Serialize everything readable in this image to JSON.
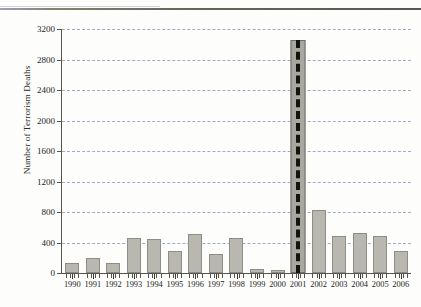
{
  "chart_data": {
    "type": "bar",
    "title": "",
    "xlabel": "",
    "ylabel": "Number of Terrorism Deaths",
    "ylim": [
      0,
      3200
    ],
    "ytick_labels": [
      "0",
      "400",
      "800",
      "1200",
      "1600",
      "2000",
      "2400",
      "2800",
      "3200"
    ],
    "ytick_values": [
      0,
      400,
      800,
      1200,
      1600,
      2000,
      2400,
      2800,
      3200
    ],
    "grid": "horizontal-dashed",
    "legend": "none",
    "categories": [
      "1990",
      "1991",
      "1992",
      "1993",
      "1994",
      "1995",
      "1996",
      "1997",
      "1998",
      "1999",
      "2000",
      "2001",
      "2002",
      "2003",
      "2004",
      "2005",
      "2006"
    ],
    "values": [
      130,
      200,
      135,
      465,
      440,
      290,
      510,
      250,
      455,
      55,
      35,
      3050,
      820,
      480,
      530,
      485,
      290
    ],
    "annotations": [
      {
        "name": "dashed-marker-2001",
        "category": "2001",
        "style": "thick-black-dashed-vertical-line",
        "color": "#14140f"
      }
    ],
    "colors": {
      "bar_fill": "#b9b8b0",
      "bar_stroke": "#8d8c85",
      "gridline": "#9aa3c4",
      "axis": "#55554e",
      "text": "#1e1e1c",
      "background": "#fdfdfb"
    }
  }
}
